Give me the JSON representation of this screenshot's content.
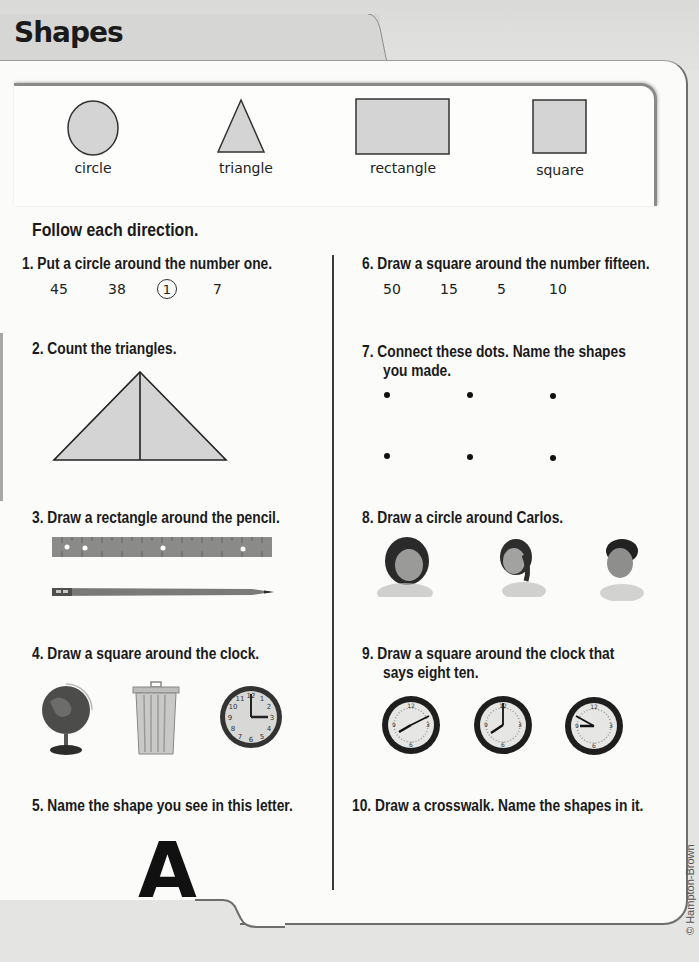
{
  "title": "Shapes",
  "legend": [
    {
      "shape": "circle",
      "label": "circle"
    },
    {
      "shape": "triangle",
      "label": "triangle"
    },
    {
      "shape": "rectangle",
      "label": "rectangle"
    },
    {
      "shape": "square",
      "label": "square"
    }
  ],
  "instructions_heading": "Follow each direction.",
  "questions": [
    {
      "number": "1.",
      "text": "Put a circle around the number one.",
      "numbers": [
        "45",
        "38",
        "1",
        "7"
      ],
      "circled": "1"
    },
    {
      "number": "2.",
      "text": "Count the triangles."
    },
    {
      "number": "3.",
      "text": "Draw a rectangle around the pencil.",
      "images": [
        "ruler",
        "pencil"
      ]
    },
    {
      "number": "4.",
      "text": "Draw a square around the clock.",
      "images": [
        "globe",
        "trash can",
        "clock"
      ]
    },
    {
      "number": "5.",
      "text": "Name the shape you see in this letter.",
      "letter": "A"
    },
    {
      "number": "6.",
      "text": "Draw a square around the number fifteen.",
      "numbers": [
        "50",
        "15",
        "5",
        "10"
      ]
    },
    {
      "number": "7.",
      "text_line1": "Connect these dots. Name the shapes",
      "text_line2": "you made."
    },
    {
      "number": "8.",
      "text": "Draw a circle around Carlos.",
      "images": [
        "girl",
        "girl",
        "boy"
      ]
    },
    {
      "number": "9.",
      "text_line1": "Draw a square around the clock that",
      "text_line2": "says eight ten.",
      "clocks": [
        "8:10",
        "8:00",
        "9:50"
      ]
    },
    {
      "number": "10.",
      "text": "Draw a crosswalk. Name the shapes in it."
    }
  ],
  "copyright": "© Hampton-Brown",
  "colors": {
    "shape_fill": "#d4d4d4",
    "shape_stroke": "#333333"
  }
}
